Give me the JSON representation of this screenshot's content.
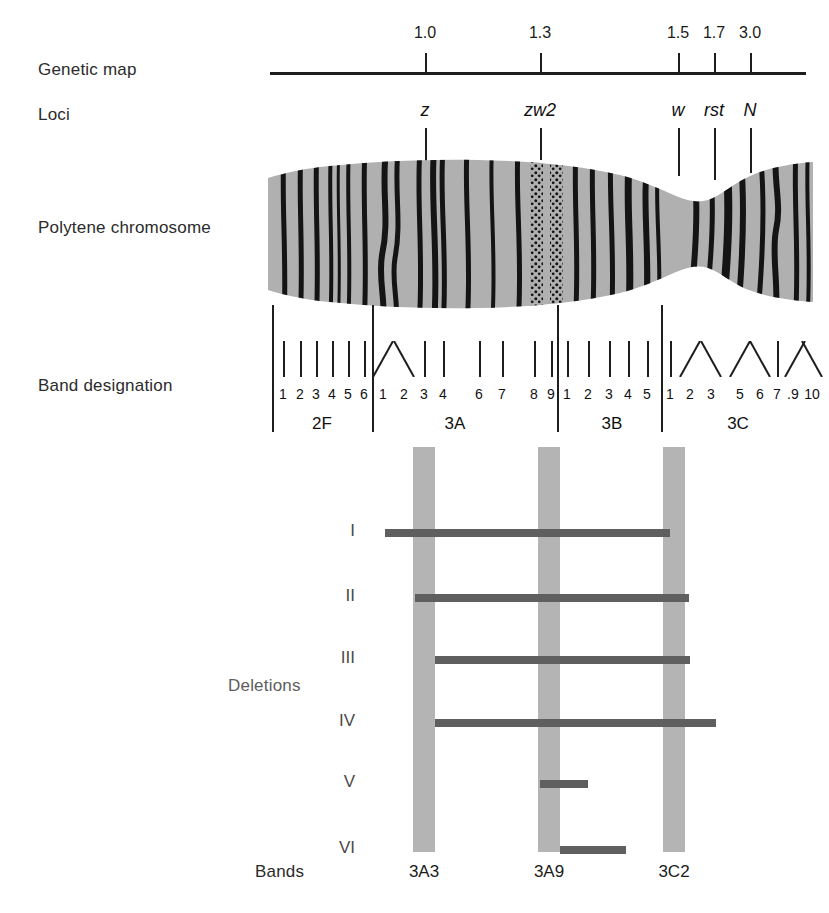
{
  "figure": {
    "row_labels": {
      "genetic_map": "Genetic map",
      "loci": "Loci",
      "polytene": "Polytene chromosome",
      "band_designation": "Band designation",
      "deletions": "Deletions",
      "bands": "Bands"
    }
  },
  "genetic_map": {
    "axis": {
      "x_start": 270,
      "x_end": 806,
      "y": 72
    },
    "ticks": [
      {
        "label": "1.0",
        "x": 425
      },
      {
        "label": "1.3",
        "x": 540
      },
      {
        "label": "1.5",
        "x": 678
      },
      {
        "label": "1.7",
        "x": 714
      },
      {
        "label": "3.0",
        "x": 750
      }
    ]
  },
  "loci": [
    {
      "label": "z",
      "x": 425
    },
    {
      "label": "zw2",
      "x": 540
    },
    {
      "label": "w",
      "x": 678
    },
    {
      "label": "rst",
      "x": 714
    },
    {
      "label": "N",
      "x": 750
    }
  ],
  "band_designation": {
    "sections": [
      {
        "name": "2F",
        "center": 322,
        "start": 272,
        "end": 372,
        "bands": [
          {
            "label": "1",
            "x": 283,
            "shape": "line"
          },
          {
            "label": "2",
            "x": 300,
            "shape": "line"
          },
          {
            "label": "3",
            "x": 316,
            "shape": "line"
          },
          {
            "label": "4",
            "x": 332,
            "shape": "line"
          },
          {
            "label": "5",
            "x": 348,
            "shape": "line"
          },
          {
            "label": "6",
            "x": 364,
            "shape": "line"
          }
        ]
      },
      {
        "name": "3A",
        "center": 455,
        "start": 372,
        "end": 557,
        "bands": [
          {
            "label": "1",
            "x": 383,
            "shape": "vleft"
          },
          {
            "label": "2",
            "x": 404,
            "shape": "vright"
          },
          {
            "label": "3",
            "x": 424,
            "shape": "line"
          },
          {
            "label": "4",
            "x": 443,
            "shape": "line"
          },
          {
            "label": "6",
            "x": 479,
            "shape": "line"
          },
          {
            "label": "7",
            "x": 502,
            "shape": "line"
          },
          {
            "label": "8",
            "x": 534,
            "shape": "line"
          },
          {
            "label": "9",
            "x": 551,
            "shape": "line"
          }
        ]
      },
      {
        "name": "3B",
        "center": 612,
        "start": 557,
        "end": 661,
        "bands": [
          {
            "label": "1",
            "x": 567,
            "shape": "line"
          },
          {
            "label": "2",
            "x": 588,
            "shape": "line"
          },
          {
            "label": "3",
            "x": 609,
            "shape": "line"
          },
          {
            "label": "4",
            "x": 628,
            "shape": "line"
          },
          {
            "label": "5",
            "x": 647,
            "shape": "line"
          }
        ]
      },
      {
        "name": "3C",
        "center": 738,
        "start": 661,
        "end": 810,
        "bands": [
          {
            "label": "1",
            "x": 670,
            "shape": "line"
          },
          {
            "label": "2",
            "x": 690,
            "shape": "vleft"
          },
          {
            "label": "3",
            "x": 711,
            "shape": "vright"
          },
          {
            "label": "5",
            "x": 740,
            "shape": "vleft"
          },
          {
            "label": "6",
            "x": 760,
            "shape": "vright"
          },
          {
            "label": "7",
            "x": 777,
            "shape": "line"
          },
          {
            "label": ".",
            "x": 789,
            "shape": "none"
          },
          {
            "label": "9",
            "x": 795,
            "shape": "vleft"
          },
          {
            "label": "10",
            "x": 812,
            "shape": "vright"
          }
        ]
      }
    ]
  },
  "deletions": {
    "columns": [
      {
        "label": "3A3",
        "x": 413,
        "width": 22
      },
      {
        "label": "3A9",
        "x": 538,
        "width": 22
      },
      {
        "label": "3C2",
        "x": 663,
        "width": 22
      }
    ],
    "column_top": 447,
    "column_bottom": 852,
    "rows": [
      {
        "label": "I",
        "y": 533,
        "bar_start": 385,
        "bar_end": 670
      },
      {
        "label": "II",
        "y": 598,
        "bar_start": 415,
        "bar_end": 689
      },
      {
        "label": "III",
        "y": 660,
        "bar_start": 435,
        "bar_end": 690
      },
      {
        "label": "IV",
        "y": 723,
        "bar_start": 435,
        "bar_end": 716
      },
      {
        "label": "V",
        "y": 784,
        "bar_start": 540,
        "bar_end": 588
      },
      {
        "label": "VI",
        "y": 850,
        "bar_start": 560,
        "bar_end": 626
      }
    ]
  },
  "colors": {
    "chromosome_fill": "#b0b0b0",
    "chromosome_band": "#141414",
    "deletion_column": "#b4b4b4",
    "deletion_bar": "#5f5f5f",
    "line": "#1d1d1d"
  },
  "chart_data": {
    "type": "diagram",
    "genetic_map_positions": [
      1.0,
      1.3,
      1.5,
      1.7,
      3.0
    ],
    "locus_names": [
      "z",
      "zw2",
      "w",
      "rst",
      "N"
    ],
    "locus_map_positions": [
      1.0,
      1.3,
      1.5,
      1.7,
      3.0
    ],
    "cytological_sections": [
      "2F",
      "3A",
      "3B",
      "3C"
    ],
    "band_numbers": {
      "2F": [
        "1",
        "2",
        "3",
        "4",
        "5",
        "6"
      ],
      "3A": [
        "1",
        "2",
        "3",
        "4",
        "6",
        "7",
        "8",
        "9"
      ],
      "3B": [
        "1",
        "2",
        "3",
        "4",
        "5"
      ],
      "3C": [
        "1",
        "2",
        "3",
        "5",
        "6",
        "7",
        ".",
        "9",
        "10"
      ]
    },
    "deletion_names": [
      "I",
      "II",
      "III",
      "IV",
      "V",
      "VI"
    ],
    "reference_bands": [
      "3A3",
      "3A9",
      "3C2"
    ],
    "deletion_coverage": [
      {
        "deletion": "I",
        "covers": [
          "3A3",
          "3A9"
        ]
      },
      {
        "deletion": "II",
        "covers": [
          "3A3",
          "3A9",
          "3C2"
        ]
      },
      {
        "deletion": "III",
        "covers": [
          "3A9",
          "3C2"
        ]
      },
      {
        "deletion": "IV",
        "covers": [
          "3A9",
          "3C2"
        ]
      },
      {
        "deletion": "V",
        "covers": [
          "3A9"
        ]
      },
      {
        "deletion": "VI",
        "covers": []
      }
    ]
  }
}
